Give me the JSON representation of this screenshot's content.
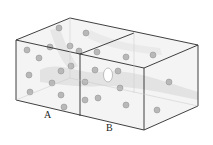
{
  "diagram": {
    "type": "two-adjacent-boxes-with-particles",
    "colors": {
      "edge": "#2a2a2a",
      "face_tint": "#f4f4f4",
      "haze": "#dcdcdc",
      "sphere": "#b8b8b8",
      "sphere_edge": "#8e8e8e",
      "void": "#ffffff"
    },
    "boxes": [
      {
        "id": "A",
        "label": "A"
      },
      {
        "id": "B",
        "label": "B"
      }
    ],
    "vertices": {
      "front_left_top": [
        16,
        40
      ],
      "front_left_bottom": [
        16,
        100
      ],
      "front_mid_top": [
        80,
        54
      ],
      "front_mid_bottom": [
        80,
        116
      ],
      "front_right_top": [
        144,
        68
      ],
      "front_right_bottom": [
        144,
        130
      ],
      "back_left_top": [
        70,
        18
      ],
      "back_mid_top": [
        134,
        33
      ],
      "back_right_top": [
        198,
        45
      ],
      "back_right_bottom": [
        198,
        106
      ]
    },
    "spheres": [
      [
        59,
        28
      ],
      [
        86,
        33
      ],
      [
        50,
        47
      ],
      [
        70,
        46
      ],
      [
        27,
        50
      ],
      [
        39,
        58
      ],
      [
        79,
        51
      ],
      [
        71,
        66
      ],
      [
        61,
        71
      ],
      [
        29,
        75
      ],
      [
        52,
        83
      ],
      [
        30,
        92
      ],
      [
        61,
        95
      ],
      [
        64,
        107
      ],
      [
        97,
        52
      ],
      [
        126,
        57
      ],
      [
        153,
        55
      ],
      [
        95,
        70
      ],
      [
        118,
        71
      ],
      [
        85,
        82
      ],
      [
        120,
        88
      ],
      [
        98,
        98
      ],
      [
        85,
        100
      ],
      [
        169,
        82
      ],
      [
        126,
        105
      ],
      [
        157,
        110
      ]
    ],
    "void": {
      "cx": 108,
      "cy": 75,
      "rx": 4.5,
      "ry": 7
    }
  }
}
